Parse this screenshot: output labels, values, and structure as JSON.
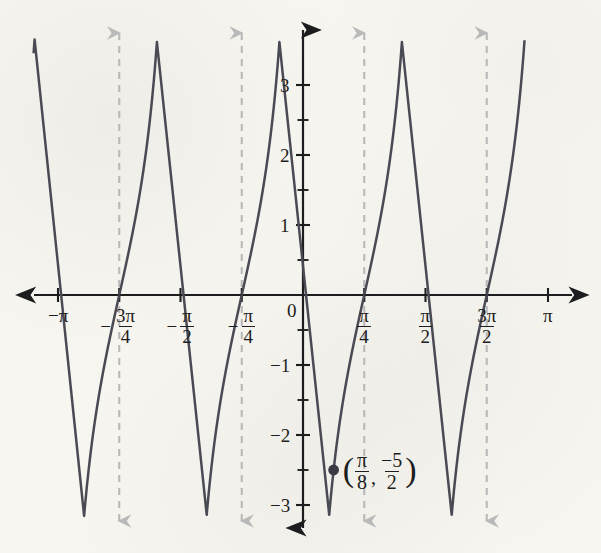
{
  "figure": {
    "background_color": "#f8f6f1",
    "curve_color": "#4a4a54",
    "axis_color": "#1d1d20",
    "asymptote_color": "#b9b9b9",
    "point_color": "#3a3a44"
  },
  "chart_data": {
    "type": "line",
    "title": "",
    "xlabel": "",
    "ylabel": "",
    "xlim": [
      -3.4557519189487724,
      3.4557519189487724
    ],
    "ylim": [
      -3.35,
      3.35
    ],
    "grid": false,
    "legend": null,
    "function_description": "y = -(5/2)cot(2x)",
    "x_ticks": [
      {
        "value": -3.141592653589793,
        "label_parts": {
          "sign": "−",
          "type": "plain",
          "text": "π"
        }
      },
      {
        "value": -2.356194490192345,
        "label_parts": {
          "sign": "−",
          "type": "fraction",
          "num": "3π",
          "den": "4"
        }
      },
      {
        "value": -1.5707963267948966,
        "label_parts": {
          "sign": "−",
          "type": "fraction",
          "num": "π",
          "den": "2"
        }
      },
      {
        "value": -0.7853981633974483,
        "label_parts": {
          "sign": "−",
          "type": "fraction",
          "num": "π",
          "den": "4"
        }
      },
      {
        "value": 0.0,
        "label_parts": {
          "sign": "",
          "type": "plain",
          "text": "0"
        }
      },
      {
        "value": 0.7853981633974483,
        "label_parts": {
          "sign": "",
          "type": "fraction",
          "num": "π",
          "den": "4"
        }
      },
      {
        "value": 1.5707963267948966,
        "label_parts": {
          "sign": "",
          "type": "fraction",
          "num": "π",
          "den": "2"
        }
      },
      {
        "value": 2.356194490192345,
        "label_parts": {
          "sign": "",
          "type": "fraction",
          "num": "3π",
          "den": "2"
        }
      },
      {
        "value": 3.141592653589793,
        "label_parts": {
          "sign": "",
          "type": "plain",
          "text": "π"
        }
      }
    ],
    "y_ticks": [
      {
        "value": 3,
        "label": "3"
      },
      {
        "value": 2,
        "label": "2"
      },
      {
        "value": 1,
        "label": "1"
      },
      {
        "value": -1,
        "label": "−1"
      },
      {
        "value": -2,
        "label": "−2"
      },
      {
        "value": -3,
        "label": "−3"
      }
    ],
    "y_minor_tick_step": 0.5,
    "asymptotes": [
      -2.356194490192345,
      -0.7853981633974483,
      0.7853981633974483,
      2.356194490192345
    ],
    "zeros": [
      -3.141592653589793,
      -1.5707963267948966,
      0.0,
      1.5707963267948966,
      3.141592653589793
    ],
    "branches": [
      {
        "x_from": -3.4557519189487724,
        "x_to": -2.356194490192345
      },
      {
        "x_from": -2.356194490192345,
        "x_to": -0.7853981633974483
      },
      {
        "x_from": -0.7853981633974483,
        "x_to": 0.7853981633974483
      },
      {
        "x_from": 0.7853981633974483,
        "x_to": 2.356194490192345
      },
      {
        "x_from": 2.356194490192345,
        "x_to": 3.4557519189487724
      }
    ],
    "annotated_point": {
      "x": 0.39269908169872414,
      "y": -2.5,
      "label": {
        "open_paren": "(",
        "x_num": "π",
        "x_den": "8",
        "comma": ",",
        "y_num": "−5",
        "y_den": "2",
        "close_paren": ")"
      }
    }
  }
}
